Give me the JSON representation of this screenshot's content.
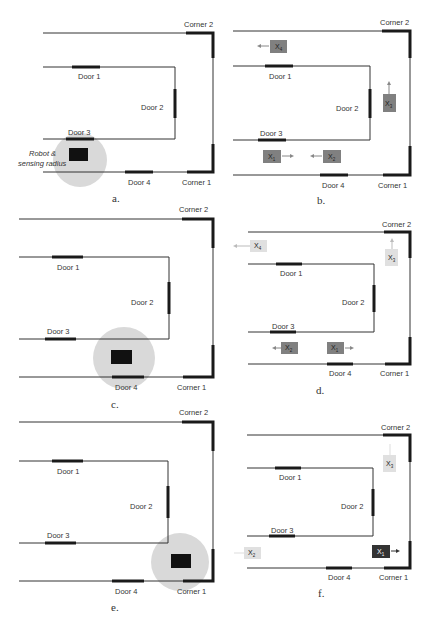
{
  "figure": {
    "labels": {
      "door1": "Door 1",
      "door2": "Door 2",
      "door3": "Door 3",
      "door4": "Door 4",
      "corner1": "Corner 1",
      "corner2": "Corner 2",
      "robot_line1": "Robot &",
      "robot_line2": "sensing radius"
    },
    "colors": {
      "wall": "#333333",
      "door": "#1a1a1a",
      "sensing_radius": "#d9d9d9",
      "robot": "#111111",
      "particle_dark": "#808080",
      "particle_light": "#e0e0e0",
      "particle_best": "#333333"
    },
    "panels": [
      {
        "id": "a",
        "caption": "a.",
        "robot": {
          "location": "near Door 3",
          "shown": true
        },
        "particles": []
      },
      {
        "id": "b",
        "caption": "b.",
        "particles": [
          {
            "name": "X4",
            "main": "X",
            "sub": "4",
            "direction": "left",
            "shade": "dark"
          },
          {
            "name": "X3",
            "main": "X",
            "sub": "3",
            "direction": "up",
            "shade": "dark"
          },
          {
            "name": "X1",
            "main": "X",
            "sub": "1",
            "direction": "right",
            "shade": "dark"
          },
          {
            "name": "X2",
            "main": "X",
            "sub": "2",
            "direction": "left",
            "shade": "dark"
          }
        ]
      },
      {
        "id": "c",
        "caption": "c.",
        "robot": {
          "location": "near Door 4",
          "shown": true
        },
        "particles": []
      },
      {
        "id": "d",
        "caption": "d.",
        "particles": [
          {
            "name": "X4",
            "main": "X",
            "sub": "4",
            "direction": "left",
            "shade": "light"
          },
          {
            "name": "X3",
            "main": "X",
            "sub": "3",
            "direction": "up",
            "shade": "light"
          },
          {
            "name": "X2",
            "main": "X",
            "sub": "2",
            "direction": "left",
            "shade": "dark"
          },
          {
            "name": "X1",
            "main": "X",
            "sub": "1",
            "direction": "right",
            "shade": "dark"
          }
        ]
      },
      {
        "id": "e",
        "caption": "e.",
        "robot": {
          "location": "near Corner 1",
          "shown": true
        },
        "particles": []
      },
      {
        "id": "f",
        "caption": "f.",
        "particles": [
          {
            "name": "X3",
            "main": "X",
            "sub": "3",
            "direction": "up",
            "shade": "light"
          },
          {
            "name": "X2",
            "main": "X",
            "sub": "2",
            "direction": "left",
            "shade": "light"
          },
          {
            "name": "X1",
            "main": "X",
            "sub": "1",
            "direction": "right",
            "shade": "best"
          }
        ]
      }
    ]
  }
}
